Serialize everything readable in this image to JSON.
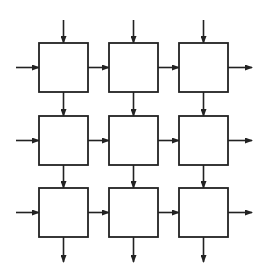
{
  "diagram": {
    "type": "systolic-array-grid",
    "rows": 3,
    "cols": 3,
    "stroke_color": "#222222",
    "background": "#ffffff",
    "cell": {
      "width": 49,
      "height": 49
    },
    "col_x": [
      39,
      109,
      179
    ],
    "row_y": [
      43,
      116,
      188
    ],
    "input_top_y": 20,
    "input_left_x": 16,
    "output_right_x": 252,
    "output_bottom_y": 262,
    "cells": [
      {
        "row": 0,
        "col": 0
      },
      {
        "row": 0,
        "col": 1
      },
      {
        "row": 0,
        "col": 2
      },
      {
        "row": 1,
        "col": 0
      },
      {
        "row": 1,
        "col": 1
      },
      {
        "row": 1,
        "col": 2
      },
      {
        "row": 2,
        "col": 0
      },
      {
        "row": 2,
        "col": 1
      },
      {
        "row": 2,
        "col": 2
      }
    ],
    "flows": {
      "vertical": "top-to-bottom",
      "horizontal": "left-to-right"
    }
  }
}
